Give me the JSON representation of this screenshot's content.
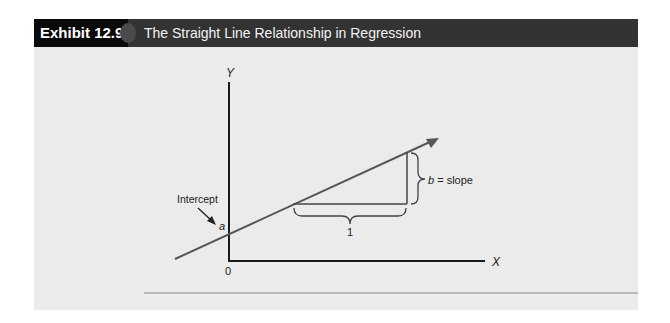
{
  "header": {
    "exhibit_number": "Exhibit 12.9",
    "title": "The Straight Line Relationship in Regression"
  },
  "diagram": {
    "y_axis_label": "Y",
    "x_axis_label": "X",
    "origin_label": "0",
    "intercept_label": "Intercept",
    "intercept_symbol": "a",
    "run_label": "1",
    "slope_symbol": "b",
    "slope_text": " = slope",
    "colors": {
      "axis": "#1a1a1a",
      "line": "#555555",
      "panel": "#ebebeb",
      "header_dark": "#333333",
      "header_black": "#0a0a0a"
    }
  }
}
